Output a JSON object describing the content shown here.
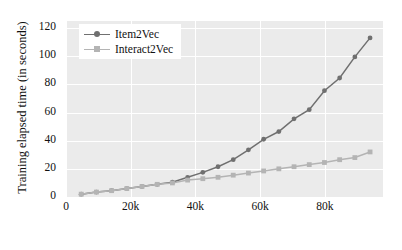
{
  "chart_data": {
    "type": "line",
    "title": "",
    "xlabel": "No. of Interactions",
    "ylabel": "Training elapsed time (in seconds)",
    "xlim": [
      0,
      98000
    ],
    "ylim": [
      0,
      125
    ],
    "grid": true,
    "legend_position": "top-left",
    "xticks": [
      {
        "value": 0,
        "label": "0"
      },
      {
        "value": 20000,
        "label": "20k"
      },
      {
        "value": 40000,
        "label": "40k"
      },
      {
        "value": 60000,
        "label": "60k"
      },
      {
        "value": 80000,
        "label": "80k"
      }
    ],
    "yticks": [
      {
        "value": 0,
        "label": "0"
      },
      {
        "value": 20,
        "label": "20"
      },
      {
        "value": 40,
        "label": "40"
      },
      {
        "value": 60,
        "label": "60"
      },
      {
        "value": 80,
        "label": "80"
      },
      {
        "value": 100,
        "label": "100"
      },
      {
        "value": 120,
        "label": "120"
      }
    ],
    "x": [
      4700,
      9400,
      14100,
      18800,
      23500,
      28200,
      32900,
      37600,
      42300,
      47000,
      51700,
      56400,
      61100,
      65800,
      70500,
      75200,
      79900,
      84600,
      89300,
      94000
    ],
    "series": [
      {
        "name": "Item2Vec",
        "color": "#707070",
        "marker": "circle",
        "values": [
          2,
          3.5,
          4.5,
          6,
          7.5,
          9,
          10.5,
          14,
          17.5,
          21.5,
          26.5,
          33.5,
          41,
          46.5,
          55.5,
          62,
          75.5,
          84.5,
          99.5,
          113
        ]
      },
      {
        "name": "Interact2Vec",
        "color": "#b4b4b4",
        "marker": "square",
        "values": [
          2,
          3.5,
          4.5,
          6,
          7.5,
          9,
          10,
          12,
          13,
          14,
          15.5,
          17,
          18.5,
          20,
          21.5,
          23,
          24.5,
          26.5,
          28,
          32
        ]
      }
    ]
  },
  "legend": {
    "items": [
      {
        "label": "Item2Vec"
      },
      {
        "label": "Interact2Vec"
      }
    ]
  },
  "colors": {
    "plot_background": "#ebebeb",
    "grid": "#ffffff",
    "figure_background": "#ffffff",
    "item2vec": "#707070",
    "interact2vec": "#b4b4b4"
  }
}
